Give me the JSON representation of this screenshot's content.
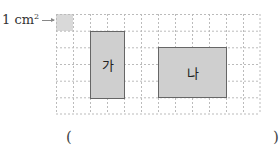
{
  "unit": {
    "label": "1 cm",
    "superscript": "2"
  },
  "grid": {
    "columns": 12,
    "rows": 6,
    "cell_cm": 1
  },
  "shapes": [
    {
      "label": "가",
      "col": 2,
      "row": 1,
      "width_cells": 2,
      "height_cells": 4
    },
    {
      "label": "나",
      "col": 6,
      "row": 2,
      "width_cells": 4,
      "height_cells": 3
    }
  ],
  "answer": {
    "open": "(",
    "close": ")",
    "value": ""
  },
  "colors": {
    "shape_fill": "#cfcfcf",
    "shape_border": "#666666",
    "grid_line": "#bbbbbb",
    "unit_fill": "#d9d9d9"
  }
}
